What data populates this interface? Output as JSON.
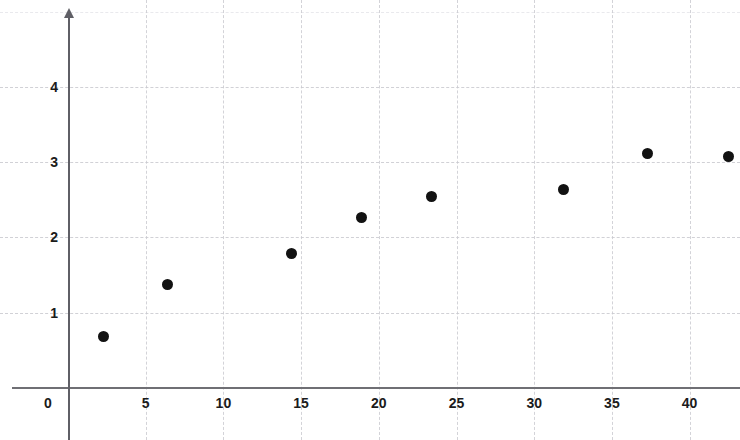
{
  "chart_data": {
    "type": "scatter",
    "title": "",
    "subtitle": "",
    "xlabel": "",
    "ylabel": "",
    "xlim": [
      -3.6,
      43.3
    ],
    "ylim": [
      -0.7,
      5.2
    ],
    "grid": true,
    "legend": false,
    "legend_position": "none",
    "point_color": "#121212",
    "axis_color": "#5f5f66",
    "grid_color": "#c9c9cf",
    "x_ticks": [
      0,
      5,
      10,
      15,
      20,
      25,
      30,
      35,
      40
    ],
    "x_tick_labels": [
      "0",
      "5",
      "10",
      "15",
      "20",
      "25",
      "30",
      "35",
      "40"
    ],
    "y_ticks": [
      1,
      2,
      3,
      4
    ],
    "y_tick_labels": [
      "1",
      "2",
      "3",
      "4"
    ],
    "extra_gridlines_y": [
      5
    ],
    "series": [
      {
        "name": "series-1",
        "marker": "circle",
        "color": "#121212",
        "points": [
          {
            "x": 2.3,
            "y": 0.69
          },
          {
            "x": 6.4,
            "y": 1.38
          },
          {
            "x": 14.4,
            "y": 1.79
          },
          {
            "x": 18.9,
            "y": 2.26
          },
          {
            "x": 23.4,
            "y": 2.54
          },
          {
            "x": 31.9,
            "y": 2.64
          },
          {
            "x": 37.3,
            "y": 3.11
          },
          {
            "x": 42.5,
            "y": 3.08
          }
        ]
      }
    ]
  }
}
